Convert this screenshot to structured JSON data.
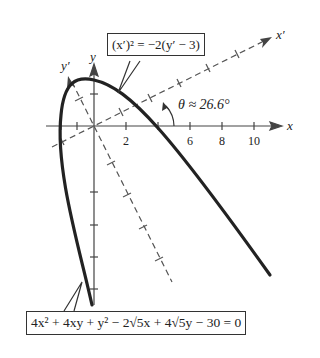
{
  "figure": {
    "rotated_equation": "(x′)² = −2(y′ − 3)",
    "original_equation": "4x² + 4xy + y² − 2√5x + 4√5y − 30 = 0",
    "angle_label": "θ ≈ 26.6°",
    "axis_labels": {
      "x": "x",
      "y": "y",
      "x_prime": "x′",
      "y_prime": "y′"
    },
    "x_tick_labels": [
      "2",
      "6",
      "8",
      "10"
    ]
  },
  "colors": {
    "curve": "#222222",
    "axes": "#444444",
    "dashed": "#555555"
  }
}
